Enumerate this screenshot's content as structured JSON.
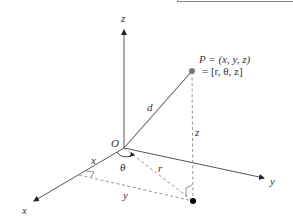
{
  "diagram": {
    "point_label_line1": "P = (x, y, z)",
    "point_label_line2": "= [r, θ, z]",
    "labels": {
      "origin": "O",
      "z_axis": "z",
      "y_axis": "y",
      "x_axis": "x",
      "distance": "d",
      "z_height": "z",
      "radius": "r",
      "angle": "θ",
      "x_segment": "x",
      "y_segment": "y"
    },
    "colors": {
      "axis": "#555555",
      "dashed": "#888888",
      "point_P": "#777777",
      "foot_point": "#000000",
      "text": "#333333"
    }
  }
}
